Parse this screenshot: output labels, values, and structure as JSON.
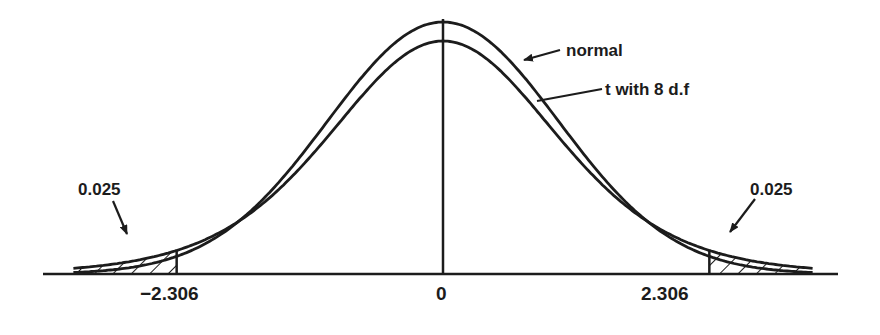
{
  "figure": {
    "background": "#ffffff",
    "ink": "#1c1c1c"
  },
  "chart_data": {
    "type": "line",
    "title": "",
    "xlabel": "",
    "ylabel": "",
    "x_range": [
      -3.6,
      3.6
    ],
    "grid": false,
    "legend": "annotations with arrows",
    "series": [
      {
        "name": "normal",
        "label": "normal",
        "distribution": "standard normal",
        "peak_density": 0.3989
      },
      {
        "name": "t with 8 d.f",
        "label": "t with 8 d.f",
        "distribution": "Student t",
        "df": 8,
        "peak_density": 0.3867
      }
    ],
    "critical_values": [
      -2.306,
      2.306
    ],
    "tail_areas": [
      {
        "side": "left",
        "from": -3.6,
        "to": -2.306,
        "area": 0.025,
        "hatched": true
      },
      {
        "side": "right",
        "from": 2.306,
        "to": 3.6,
        "area": 0.025,
        "hatched": true
      }
    ],
    "tick_labels": [
      "−2.306",
      "0",
      "2.306"
    ],
    "annotations": [
      "normal",
      "t with 8 d.f",
      "0.025",
      "0.025"
    ]
  },
  "labels": {
    "tick_left": "−2.306",
    "tick_center": "0",
    "tick_right": "2.306",
    "normal": "normal",
    "t_curve": "t with 8 d.f",
    "tail_left": "0.025",
    "tail_right": "0.025"
  },
  "geometry": {
    "center_x": 443,
    "baseline_y": 274,
    "px_per_unit": 115.5,
    "x_min": -3.2,
    "x_max": 3.2,
    "normal_peak_y": 22,
    "t_peak_y": 41,
    "axis_left": 43,
    "axis_right": 838
  }
}
